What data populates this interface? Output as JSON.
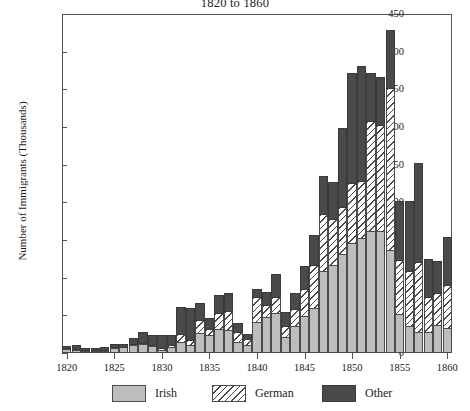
{
  "chart_data": {
    "type": "bar",
    "stacked": true,
    "title": "1820 to 1860",
    "xlabel": "",
    "ylabel": "Number of Immigrants (Thousands)",
    "xlim": [
      1819.5,
      1860.5
    ],
    "ylim": [
      0,
      450
    ],
    "ytick_step": 50,
    "xtick_step": 5,
    "grid": false,
    "legend_position": "bottom",
    "categories": [
      1820,
      1821,
      1822,
      1823,
      1824,
      1825,
      1826,
      1827,
      1828,
      1829,
      1830,
      1831,
      1832,
      1833,
      1834,
      1835,
      1836,
      1837,
      1838,
      1839,
      1840,
      1841,
      1842,
      1843,
      1844,
      1845,
      1846,
      1847,
      1848,
      1849,
      1850,
      1851,
      1852,
      1853,
      1854,
      1855,
      1856,
      1857,
      1858,
      1859,
      1860
    ],
    "yticks": [
      0,
      50,
      100,
      150,
      200,
      250,
      300,
      350,
      400,
      450
    ],
    "xticks": [
      1820,
      1825,
      1830,
      1835,
      1840,
      1845,
      1850,
      1855,
      1860
    ],
    "series": [
      {
        "name": "Irish",
        "color": "#bdbdbd",
        "pattern": "solid",
        "values": [
          4,
          3,
          2,
          2,
          2,
          5,
          6,
          9,
          10,
          8,
          3,
          6,
          13,
          9,
          25,
          22,
          31,
          29,
          13,
          9,
          40,
          46,
          52,
          20,
          34,
          48,
          58,
          108,
          116,
          130,
          145,
          152,
          160,
          160,
          135,
          50,
          35,
          27,
          27,
          36,
          32
        ]
      },
      {
        "name": "German",
        "color": "#ffffff",
        "pattern": "diagonal-hatch",
        "values": [
          1,
          1,
          1,
          1,
          1,
          1,
          1,
          1,
          2,
          1,
          2,
          3,
          11,
          7,
          18,
          9,
          21,
          25,
          13,
          8,
          33,
          16,
          21,
          15,
          23,
          35,
          58,
          75,
          60,
          62,
          79,
          75,
          146,
          142,
          216,
          72,
          72,
          92,
          46,
          42,
          57
        ]
      },
      {
        "name": "Other",
        "color": "#4a4a4a",
        "pattern": "solid",
        "values": [
          3,
          5,
          3,
          3,
          4,
          4,
          4,
          8,
          15,
          13,
          18,
          13,
          36,
          42,
          22,
          14,
          24,
          25,
          13,
          7,
          11,
          18,
          31,
          18,
          21,
          31,
          39,
          51,
          50,
          105,
          146,
          153,
          64,
          63,
          76,
          79,
          93,
          132,
          51,
          43,
          64
        ]
      }
    ],
    "totals": [
      8,
      9,
      6,
      6,
      7,
      10,
      11,
      18,
      27,
      22,
      23,
      22,
      60,
      58,
      65,
      45,
      76,
      79,
      39,
      24,
      84,
      80,
      104,
      53,
      78,
      114,
      155,
      234,
      226,
      297,
      370,
      380,
      370,
      365,
      427,
      201,
      200,
      251,
      124,
      121,
      153
    ]
  },
  "legend": {
    "items": [
      {
        "label": "Irish",
        "swatch": "solid-gray"
      },
      {
        "label": "German",
        "swatch": "hatched"
      },
      {
        "label": "Other",
        "swatch": "solid-dark"
      }
    ]
  },
  "colors": {
    "irish": "#bdbdbd",
    "german": "#ffffff",
    "other": "#4a4a4a",
    "outline": "#4a4a4a",
    "axis": "#555555",
    "background": "#ffffff"
  }
}
